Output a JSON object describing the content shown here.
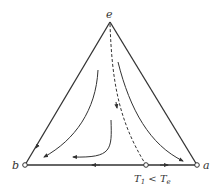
{
  "diagram": {
    "type": "ternary-phase-diagram",
    "vertices": {
      "apex": {
        "label": "e"
      },
      "left": {
        "label": "b"
      },
      "right": {
        "label": "a"
      }
    },
    "base_point_label": "T",
    "base_point_sub1": "1",
    "base_point_op": " < ",
    "base_point_sub2": "e",
    "colors": {
      "line": "#333333",
      "background": "#ffffff"
    }
  }
}
